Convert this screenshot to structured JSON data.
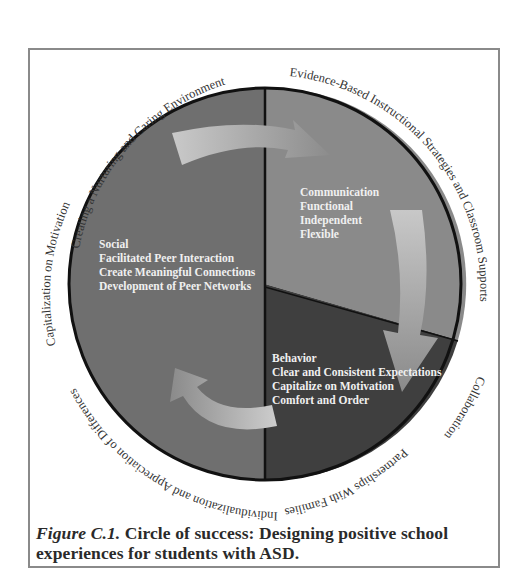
{
  "figure": {
    "ring_labels": {
      "top_left": "Creating a Nurturing and Caring Environment",
      "top_right": "Evidence-Based Instructional Strategies and Classroom Supports",
      "right_lower": "Collaboration",
      "bottom_right": "Partnerships With Families",
      "bottom_left": "Individualization and Appreciation of Differences",
      "left": "Capitalization on Motivation"
    },
    "sectors": {
      "social": {
        "title": "Social",
        "items": [
          "Facilitated Peer Interaction",
          "Create Meaningful Connections",
          "Development of Peer Networks"
        ]
      },
      "communication": {
        "title": "Communication",
        "items": [
          "Functional",
          "Independent",
          "Flexible"
        ]
      },
      "behavior": {
        "title": "Behavior",
        "items": [
          "Clear and Consistent Expectations",
          "Capitalize on Motivation",
          "Comfort and Order"
        ]
      }
    },
    "colors": {
      "social_sector": "#6f6f6f",
      "communication_sector": "#8a8a8a",
      "behavior_sector": "#3f3f3f",
      "arrow_light": "#c4c4c4",
      "arrow_dark": "#8e8e8e",
      "outline": "#111111",
      "frame_border": "#8a8a8a"
    }
  },
  "caption": {
    "label": "Figure C.1.",
    "text": " Circle of success: Designing positive school experiences for students with ASD."
  }
}
